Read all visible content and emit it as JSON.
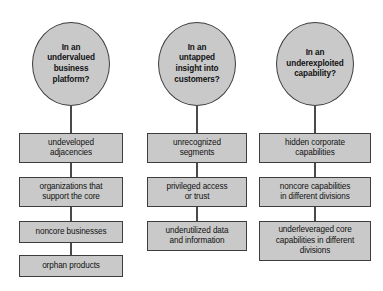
{
  "diagram": {
    "background_color": "#ffffff",
    "node_fill_color": "#c9c9c9",
    "node_border_color": "#3d3d3d",
    "text_color": "#111111",
    "columns": [
      {
        "id": "undervalued-business-platform",
        "question": "In an\nundervalued\nbusiness\nplatform?",
        "items": [
          "undeveloped\nadjacencies",
          "organizations that\nsupport the core",
          "noncore businesses",
          "orphan products"
        ]
      },
      {
        "id": "untapped-insight-into-customers",
        "question": "In an\nuntapped\ninsight into\ncustomers?",
        "items": [
          "unrecognized\nsegments",
          "privileged access\nor trust",
          "underutilized data\nand information"
        ]
      },
      {
        "id": "underexploited-capability",
        "question": "In an\nunderexploited\ncapability?",
        "items": [
          "hidden corporate\ncapabilities",
          "noncore capabilities\nin different divisions",
          "underleveraged core\ncapabilities in different\ndivisions"
        ]
      }
    ]
  }
}
